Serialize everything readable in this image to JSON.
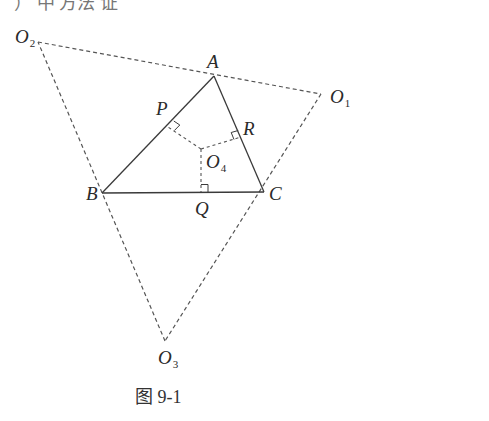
{
  "top_cut_text": "）  中  方法  证",
  "caption": "图 9-1",
  "colors": {
    "stroke": "#3a3a3a",
    "dashed": "#555555",
    "text": "#2a2a2a"
  },
  "points": {
    "A": {
      "label": "A",
      "x": 214,
      "y": 76
    },
    "B": {
      "label": "B",
      "x": 102,
      "y": 193
    },
    "C": {
      "label": "C",
      "x": 264,
      "y": 192
    },
    "P": {
      "label": "P",
      "x": 168,
      "y": 127
    },
    "Q": {
      "label": "Q",
      "x": 201,
      "y": 192
    },
    "R": {
      "label": "R",
      "x": 241,
      "y": 137
    },
    "O1": {
      "label": "O",
      "sub": "1",
      "x": 321,
      "y": 94
    },
    "O2": {
      "label": "O",
      "sub": "2",
      "x": 38,
      "y": 42
    },
    "O3": {
      "label": "O",
      "sub": "3",
      "x": 165,
      "y": 341
    },
    "O4": {
      "label": "O",
      "sub": "4",
      "x": 201,
      "y": 149
    }
  },
  "segments": {
    "solid": [
      [
        "A",
        "B"
      ],
      [
        "B",
        "C"
      ],
      [
        "C",
        "A"
      ]
    ],
    "dashed": [
      [
        "O2",
        "O1"
      ],
      [
        "O1",
        "O3"
      ],
      [
        "O3",
        "O2"
      ],
      [
        "O4",
        "P"
      ],
      [
        "O4",
        "Q"
      ],
      [
        "O4",
        "R"
      ]
    ]
  },
  "right_angle_marks": [
    "P",
    "Q",
    "R"
  ]
}
